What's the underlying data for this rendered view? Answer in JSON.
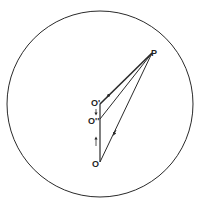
{
  "diagram": {
    "labels": {
      "P": "P",
      "O_prime": "O'",
      "O_double_prime": "O''",
      "O": "O"
    },
    "colors": {
      "stroke": "#2a2a2a",
      "background": "#ffffff"
    },
    "circle": {
      "cx": 100,
      "cy": 104,
      "r": 93
    },
    "points": {
      "P": [
        152,
        53
      ],
      "O_prime": [
        100,
        104
      ],
      "O_double_prime": [
        100,
        119
      ],
      "O": [
        100,
        162
      ]
    }
  }
}
